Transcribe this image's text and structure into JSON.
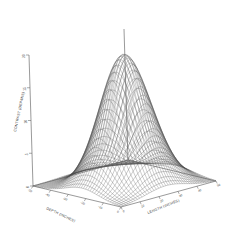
{
  "chart_data": {
    "type": "surface",
    "title": "",
    "xlabel": "DEPTH (INCHES)",
    "ylabel": "LENGTH (INCHES)",
    "zlabel": "CONTRAST (DEP/INS)",
    "projection": "3d-wireframe",
    "grid": true,
    "legend": null,
    "x": [
      -50,
      -40,
      -30,
      -20,
      -10,
      0
    ],
    "y": [
      0,
      10,
      20,
      30,
      40,
      50
    ],
    "zlim": [
      0,
      20
    ],
    "xlim": [
      -50,
      0
    ],
    "ylim": [
      0,
      50
    ],
    "x_ticks": [
      "-50",
      "-40",
      "-30",
      "-20",
      "-10",
      "0"
    ],
    "y_ticks": [
      "0",
      "10",
      "20",
      "30",
      "40",
      "50"
    ],
    "z_ticks": [
      "0",
      "5",
      "10",
      "15",
      "20"
    ],
    "surface_model": {
      "form": "gaussian-peak",
      "peak_value": 20,
      "peak_x": -22,
      "peak_y": 24,
      "sigma_x": 9.5,
      "sigma_y": 10.5,
      "baseline": 0.0,
      "grid_nx": 41,
      "grid_ny": 41
    },
    "z_values_note": "Z surface computed as gaussian peak over the (depth,length) plane; baseline flat at 0."
  },
  "figure": {
    "background_color": "#ffffff",
    "line_color": "#4a4a4a",
    "axis_color": "#555555"
  }
}
